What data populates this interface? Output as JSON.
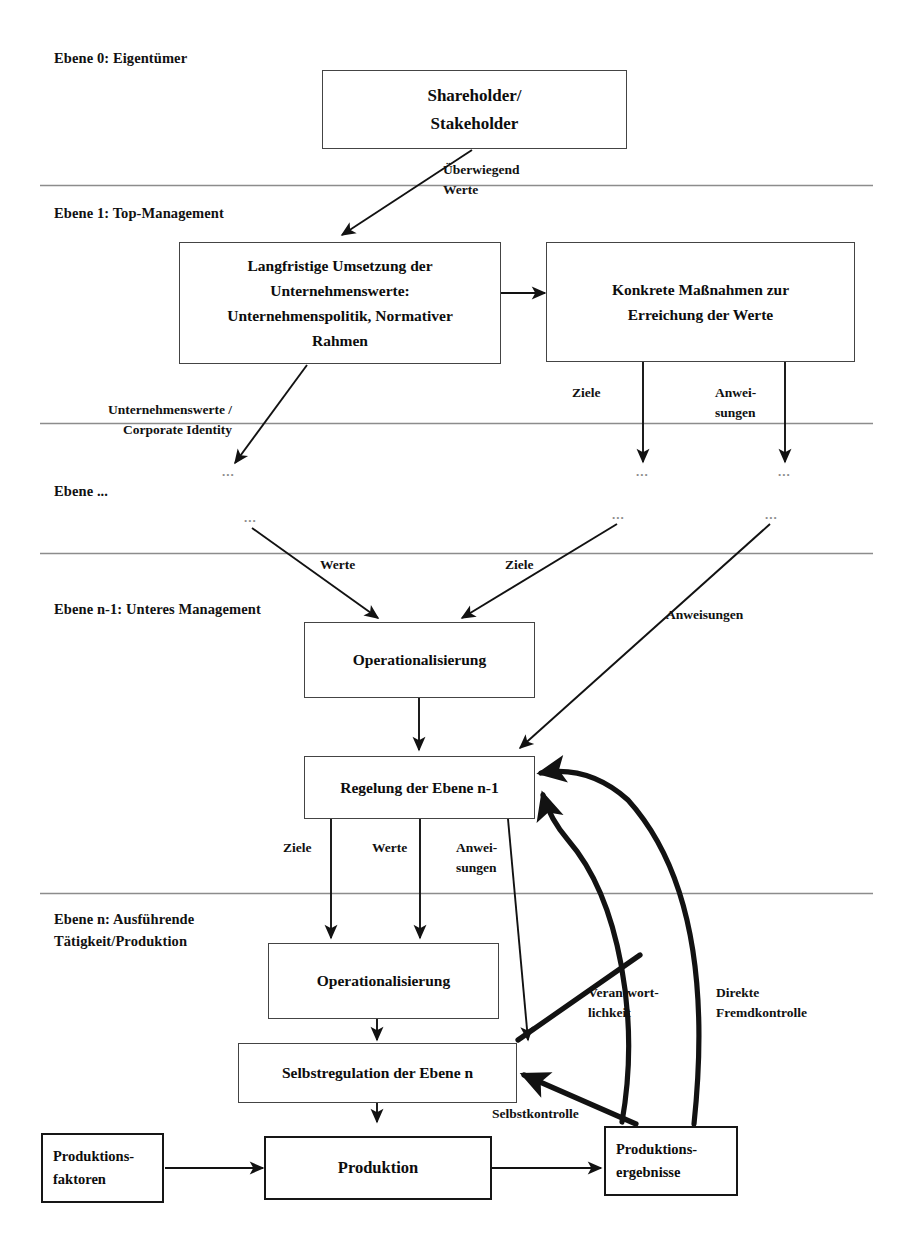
{
  "diagram": {
    "title_visible": false,
    "colors": {
      "ink": "#111111",
      "box_border": "#444444",
      "heavy_border": "#161616",
      "separator": "#808080",
      "dots": "#8a8a8a",
      "background": "#ffffff"
    },
    "levels": [
      {
        "id": "level-0",
        "label": "Ebene 0: Eigentümer"
      },
      {
        "id": "level-1",
        "label": "Ebene 1: Top-Management"
      },
      {
        "id": "level-mid",
        "label": "Ebene ..."
      },
      {
        "id": "level-n-1",
        "label": "Ebene n-1: Unteres Management"
      },
      {
        "id": "level-n",
        "label": "Ebene n: Ausführende\nTätigkeit/Produktion"
      }
    ],
    "nodes": [
      {
        "id": "shareholder",
        "label": "Shareholder/\nStakeholder"
      },
      {
        "id": "langfristige-umsetzung",
        "label": "Langfristige Umsetzung der\nUnternehmenswerte:\nUnternehmenspolitik, Normativer\nRahmen"
      },
      {
        "id": "konkrete-massnahmen",
        "label": "Konkrete Maßnahmen zur\nErreichung der Werte"
      },
      {
        "id": "operationalisierung-n-1",
        "label": "Operationalisierung"
      },
      {
        "id": "regelung-ebene-n-1",
        "label": "Regelung der Ebene n-1"
      },
      {
        "id": "operationalisierung-n",
        "label": "Operationalisierung"
      },
      {
        "id": "selbstregulation-ebene-n",
        "label": "Selbstregulation der Ebene n"
      },
      {
        "id": "produktionsfaktoren",
        "label": "Produktions-\nfaktoren"
      },
      {
        "id": "produktion",
        "label": "Produktion"
      },
      {
        "id": "produktionsergebnisse",
        "label": "Produktions-\nergebnisse"
      }
    ],
    "edge_labels": [
      {
        "id": "ueberwiegend-werte",
        "label": "Überwiegend\nWerte"
      },
      {
        "id": "unternehmenswerte-corporate-identity",
        "label": "Unternehmenswerte /\nCorporate Identity"
      },
      {
        "id": "ziele-top",
        "label": "Ziele"
      },
      {
        "id": "anweisungen-top",
        "label": "Anwei-\nsungen"
      },
      {
        "id": "werte-mid",
        "label": "Werte"
      },
      {
        "id": "ziele-mid",
        "label": "Ziele"
      },
      {
        "id": "anweisungen-mid",
        "label": "Anweisungen"
      },
      {
        "id": "ziele-low",
        "label": "Ziele"
      },
      {
        "id": "werte-low",
        "label": "Werte"
      },
      {
        "id": "anweisungen-low",
        "label": "Anwei-\nsungen"
      },
      {
        "id": "verantwortlichkeit",
        "label": "Verantwort-\nlichkeit"
      },
      {
        "id": "direkte-fremdkontrolle",
        "label": "Direkte\nFremdkontrolle"
      },
      {
        "id": "selbstkontrolle",
        "label": "Selbstkontrolle"
      }
    ],
    "ellipsis_marks": [
      {
        "id": "dots-a",
        "label": "..."
      },
      {
        "id": "dots-b",
        "label": "..."
      },
      {
        "id": "dots-c",
        "label": "..."
      },
      {
        "id": "dots-d",
        "label": "..."
      },
      {
        "id": "dots-e",
        "label": "..."
      },
      {
        "id": "dots-f",
        "label": "..."
      }
    ]
  }
}
